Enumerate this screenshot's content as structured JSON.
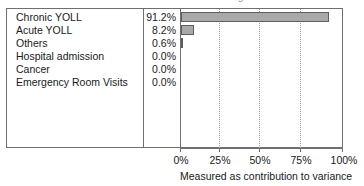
{
  "chart_data": {
    "type": "bar",
    "orientation": "horizontal",
    "title": "due to Human Health damages",
    "categories": [
      "Chronic YOLL",
      "Acute YOLL",
      "Others",
      "Hospital admission",
      "Cancer",
      "Emergency Room Visits"
    ],
    "values": [
      91.2,
      8.2,
      0.6,
      0.0,
      0.0,
      0.0
    ],
    "value_labels": [
      "91.2%",
      "8.2%",
      "0.6%",
      "0.0%",
      "0.0%",
      "0.0%"
    ],
    "xlabel": "Measured as contribution to variance",
    "ylabel": "",
    "xlim": [
      0,
      100
    ],
    "xticks": [
      0,
      25,
      50,
      75,
      100
    ],
    "xtick_labels": [
      "0%",
      "25%",
      "50%",
      "75%",
      "100%"
    ],
    "grid": "vertical-dotted",
    "legend": "none",
    "bar_color": "#a9a9a9",
    "bar_edge_color": "#5e5e5e",
    "frame_color": "#6f6f6f",
    "gridline_color": "#9a9a9a"
  }
}
